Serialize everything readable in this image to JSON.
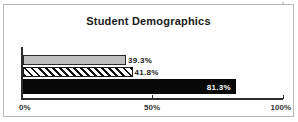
{
  "chart_data": {
    "type": "bar",
    "orientation": "horizontal",
    "title": "Student Demographics",
    "xlabel": "",
    "ylabel": "",
    "xlim": [
      0,
      100
    ],
    "grid": false,
    "legend": "none",
    "categories": [
      "Series 1",
      "Series 2",
      "Series 3"
    ],
    "values": [
      39.3,
      41.8,
      81.3
    ],
    "bars": [
      {
        "label": "39.3%",
        "value": 39.3,
        "fill": "solid-light-gray",
        "color": "#bfbfbf",
        "label_position": "outside"
      },
      {
        "label": "41.8%",
        "value": 41.8,
        "fill": "diagonal-hatch",
        "color": "#ffffff",
        "label_position": "outside"
      },
      {
        "label": "81.3%",
        "value": 81.3,
        "fill": "solid-black",
        "color": "#080808",
        "label_position": "inside"
      }
    ],
    "axis_ticks": [
      {
        "label": "0%",
        "value": 0
      },
      {
        "label": "50%",
        "value": 50
      },
      {
        "label": "100%",
        "value": 100
      }
    ]
  },
  "colors": {
    "frame": "#b9b9b9",
    "axis": "#2b2b2b",
    "text": "#1a1a1a",
    "inside_label": "#ffffff"
  }
}
